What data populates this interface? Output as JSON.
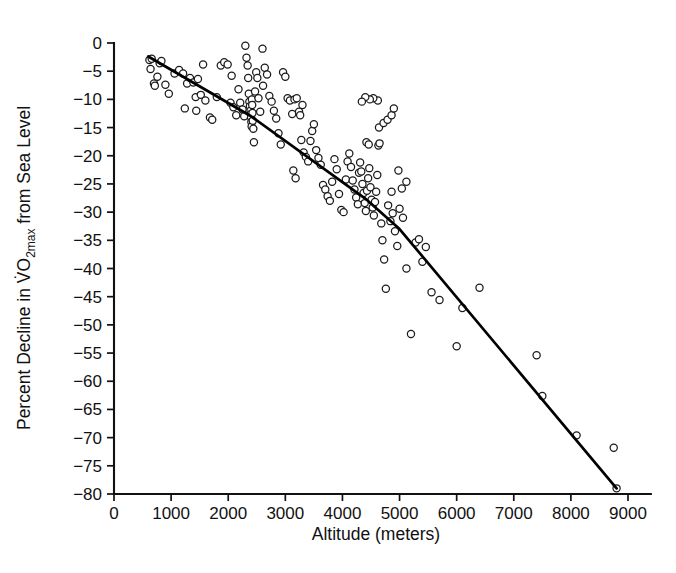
{
  "figure": {
    "background_color": "#ffffff",
    "foreground_color": "#111111",
    "marker_color": "#ffffff",
    "marker_edge_color": "#1a1a1a",
    "line_color": "#000000"
  },
  "chart_data": {
    "type": "scatter",
    "title": "",
    "subtitle": "",
    "xlabel": "Altitude (meters)",
    "ylabel": "Percent Decline in V̇O2max from Sea Level",
    "ylabel_parts": {
      "prefix": "Percent Decline in ",
      "symbol": "V̇O",
      "subscript": "2max",
      "suffix": " from Sea Level"
    },
    "xlim": [
      0,
      9400
    ],
    "ylim": [
      -80,
      2
    ],
    "xticks": [
      0,
      1000,
      2000,
      3000,
      4000,
      5000,
      6000,
      7000,
      8000,
      9000
    ],
    "xticklabels": [
      "0",
      "1000",
      "2000",
      "3000",
      "4000",
      "5000",
      "6000",
      "7000",
      "8000",
      "9000"
    ],
    "yticks": [
      0,
      -5,
      -10,
      -15,
      -20,
      -25,
      -30,
      -35,
      -40,
      -45,
      -50,
      -55,
      -60,
      -65,
      -70,
      -75,
      -80
    ],
    "yticklabels": [
      "0",
      "−5",
      "−10",
      "−15",
      "−20",
      "−25",
      "−30",
      "−35",
      "−40",
      "−45",
      "−50",
      "−55",
      "−60",
      "−65",
      "−70",
      "−75",
      "−80"
    ],
    "grid": false,
    "legend": null,
    "marker_style": "open-circle",
    "marker_radius_px": 3.6,
    "series": [
      {
        "name": "Observations",
        "type": "scatter",
        "points": [
          [
            620,
            -3.0
          ],
          [
            640,
            -4.6
          ],
          [
            660,
            -2.8
          ],
          [
            700,
            -7.2
          ],
          [
            715,
            -7.6
          ],
          [
            760,
            -6.0
          ],
          [
            800,
            -3.6
          ],
          [
            830,
            -3.2
          ],
          [
            900,
            -7.4
          ],
          [
            960,
            -9.0
          ],
          [
            1060,
            -5.4
          ],
          [
            1140,
            -4.8
          ],
          [
            1210,
            -5.4
          ],
          [
            1280,
            -7.2
          ],
          [
            1330,
            -6.2
          ],
          [
            1390,
            -7.0
          ],
          [
            1430,
            -9.6
          ],
          [
            1470,
            -6.4
          ],
          [
            1520,
            -9.2
          ],
          [
            1560,
            -3.8
          ],
          [
            1600,
            -10.2
          ],
          [
            1680,
            -13.2
          ],
          [
            1720,
            -13.6
          ],
          [
            1800,
            -9.6
          ],
          [
            1870,
            -4.0
          ],
          [
            1930,
            -3.4
          ],
          [
            1990,
            -3.8
          ],
          [
            2040,
            -10.6
          ],
          [
            2090,
            -11.4
          ],
          [
            2140,
            -12.8
          ],
          [
            2180,
            -8.2
          ],
          [
            2210,
            -10.6
          ],
          [
            2250,
            -11.8
          ],
          [
            2280,
            -13.0
          ],
          [
            2300,
            -0.5
          ],
          [
            2320,
            -2.6
          ],
          [
            2340,
            -4.0
          ],
          [
            2350,
            -6.2
          ],
          [
            2360,
            -9.0
          ],
          [
            2370,
            -10.4
          ],
          [
            2380,
            -11.2
          ],
          [
            2390,
            -12.0
          ],
          [
            2395,
            -12.6
          ],
          [
            2400,
            -13.2
          ],
          [
            2405,
            -14.0
          ],
          [
            2410,
            -14.8
          ],
          [
            2415,
            -10.0
          ],
          [
            2420,
            -11.0
          ],
          [
            2425,
            -12.4
          ],
          [
            2430,
            -13.8
          ],
          [
            2440,
            -15.2
          ],
          [
            2450,
            -17.6
          ],
          [
            2470,
            -8.6
          ],
          [
            2490,
            -5.2
          ],
          [
            2510,
            -6.2
          ],
          [
            2530,
            -9.8
          ],
          [
            2560,
            -12.2
          ],
          [
            2600,
            -1.0
          ],
          [
            2640,
            -4.4
          ],
          [
            2680,
            -5.6
          ],
          [
            2720,
            -9.4
          ],
          [
            2760,
            -10.4
          ],
          [
            2800,
            -12.0
          ],
          [
            2840,
            -13.4
          ],
          [
            2880,
            -16.0
          ],
          [
            2920,
            -18.0
          ],
          [
            2960,
            -5.2
          ],
          [
            3000,
            -6.0
          ],
          [
            3040,
            -9.8
          ],
          [
            3080,
            -10.2
          ],
          [
            3120,
            -12.6
          ],
          [
            3160,
            -10.0
          ],
          [
            3200,
            -9.8
          ],
          [
            3240,
            -12.2
          ],
          [
            3280,
            -17.2
          ],
          [
            3320,
            -19.4
          ],
          [
            3360,
            -20.2
          ],
          [
            3400,
            -21.0
          ],
          [
            3440,
            -17.4
          ],
          [
            3470,
            -15.6
          ],
          [
            3500,
            -14.4
          ],
          [
            3540,
            -19.0
          ],
          [
            3580,
            -20.4
          ],
          [
            3620,
            -21.6
          ],
          [
            3660,
            -25.2
          ],
          [
            3700,
            -26.0
          ],
          [
            3740,
            -27.2
          ],
          [
            3780,
            -28.0
          ],
          [
            3820,
            -24.6
          ],
          [
            3860,
            -20.6
          ],
          [
            3900,
            -22.4
          ],
          [
            3940,
            -26.8
          ],
          [
            3980,
            -29.6
          ],
          [
            4020,
            -30.0
          ],
          [
            4060,
            -24.2
          ],
          [
            4090,
            -21.0
          ],
          [
            4120,
            -19.6
          ],
          [
            4150,
            -22.0
          ],
          [
            4180,
            -24.4
          ],
          [
            4210,
            -26.0
          ],
          [
            4240,
            -27.4
          ],
          [
            4270,
            -28.6
          ],
          [
            4290,
            -23.0
          ],
          [
            4310,
            -21.2
          ],
          [
            4330,
            -22.8
          ],
          [
            4350,
            -25.0
          ],
          [
            4370,
            -26.6
          ],
          [
            4390,
            -28.4
          ],
          [
            4410,
            -29.8
          ],
          [
            4430,
            -26.2
          ],
          [
            4450,
            -24.0
          ],
          [
            4470,
            -22.2
          ],
          [
            4490,
            -25.6
          ],
          [
            4510,
            -27.8
          ],
          [
            4530,
            -29.2
          ],
          [
            4550,
            -30.6
          ],
          [
            4570,
            -28.2
          ],
          [
            4590,
            -26.4
          ],
          [
            4610,
            -23.4
          ],
          [
            4630,
            -18.2
          ],
          [
            4650,
            -17.8
          ],
          [
            4680,
            -32.0
          ],
          [
            4700,
            -35.0
          ],
          [
            4730,
            -38.4
          ],
          [
            4760,
            -43.6
          ],
          [
            4800,
            -28.8
          ],
          [
            4840,
            -31.6
          ],
          [
            4880,
            -30.2
          ],
          [
            4920,
            -33.4
          ],
          [
            4960,
            -36.0
          ],
          [
            5000,
            -29.4
          ],
          [
            5060,
            -31.0
          ],
          [
            5120,
            -40.0
          ],
          [
            5200,
            -51.6
          ],
          [
            5280,
            -35.4
          ],
          [
            5340,
            -34.8
          ],
          [
            5400,
            -38.8
          ],
          [
            5460,
            -36.2
          ],
          [
            5560,
            -44.2
          ],
          [
            5700,
            -45.6
          ],
          [
            6000,
            -53.8
          ],
          [
            6100,
            -47.0
          ],
          [
            6400,
            -43.4
          ],
          [
            7400,
            -55.4
          ],
          [
            7500,
            -62.6
          ],
          [
            8100,
            -69.6
          ],
          [
            8750,
            -71.8
          ],
          [
            8800,
            -79.0
          ],
          [
            4420,
            -17.6
          ],
          [
            4460,
            -18.0
          ],
          [
            3260,
            -12.8
          ],
          [
            3300,
            -11.0
          ],
          [
            1240,
            -11.6
          ],
          [
            1440,
            -12.0
          ],
          [
            2060,
            -5.8
          ],
          [
            2610,
            -7.6
          ],
          [
            3140,
            -22.6
          ],
          [
            3180,
            -24.0
          ],
          [
            5040,
            -25.8
          ],
          [
            4860,
            -26.4
          ],
          [
            5120,
            -24.6
          ],
          [
            4980,
            -22.6
          ],
          [
            4640,
            -15.0
          ],
          [
            4720,
            -14.2
          ],
          [
            4790,
            -13.6
          ],
          [
            4860,
            -12.8
          ],
          [
            4900,
            -11.6
          ],
          [
            4620,
            -10.2
          ],
          [
            4540,
            -9.8
          ],
          [
            4480,
            -10.0
          ],
          [
            4400,
            -9.6
          ],
          [
            4340,
            -10.4
          ]
        ]
      },
      {
        "name": "Fitted line",
        "type": "line",
        "points": [
          [
            600,
            -2.4
          ],
          [
            2400,
            -13.0
          ],
          [
            4400,
            -27.6
          ],
          [
            5000,
            -33.0
          ],
          [
            8800,
            -79.0
          ]
        ]
      }
    ]
  }
}
